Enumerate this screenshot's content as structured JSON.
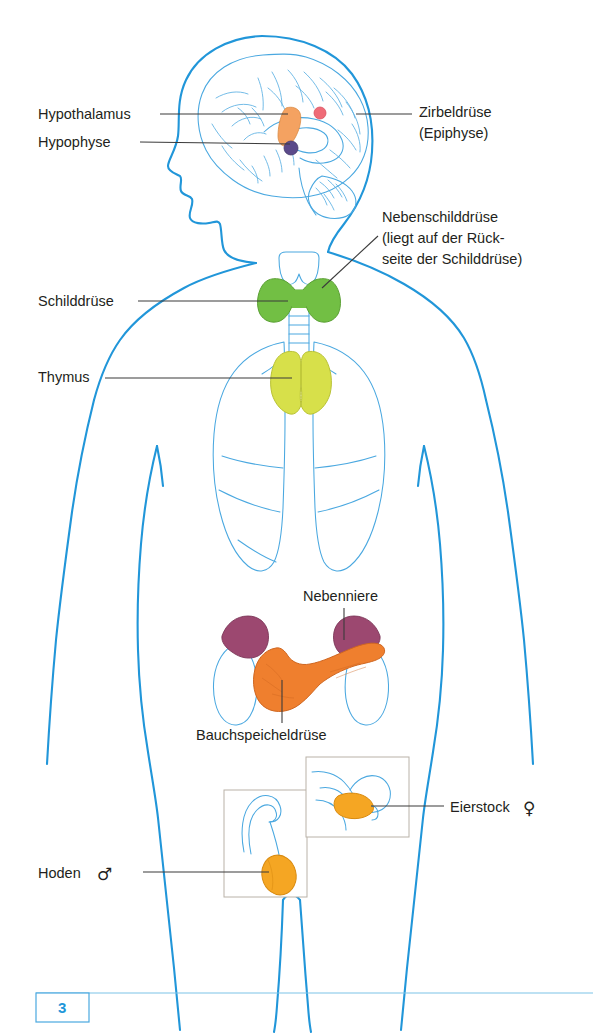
{
  "document": {
    "title": "Hormondrüsen des Menschen",
    "page_number": "3",
    "language": "de"
  },
  "colors": {
    "body_outline": "#2196d9",
    "organ_outline": "#4aa8e0",
    "leader_line": "#3b3b3b",
    "text": "#231f20",
    "thyroid_green": "#72bf44",
    "thymus_yellow": "#d7e04a",
    "pancreas_orange": "#ef7f2e",
    "adrenal_purple": "#9c4870",
    "hypothalamus_orange": "#f4a261",
    "hypophyse_violet": "#5b4a8a",
    "pineal_pink": "#ef6b77",
    "gonad_orange": "#f5a623",
    "inset_border": "#b9b2a8",
    "page_number_blue": "#2196d9"
  },
  "labels": [
    {
      "id": "hypothalamus",
      "lines": [
        "Hypothalamus"
      ],
      "side": "left",
      "text_x": 38,
      "text_y": 119,
      "leader": "M 160 114 L 288 114",
      "organ_color": "#f4a261"
    },
    {
      "id": "hypophyse",
      "lines": [
        "Hypophyse"
      ],
      "side": "left",
      "text_x": 38,
      "text_y": 147,
      "leader": "M 140 142 L 293 142",
      "organ_color": "#5b4a8a"
    },
    {
      "id": "zirbeldruese",
      "lines": [
        "Zirbeldrüse",
        "(Epiphyse)"
      ],
      "side": "right",
      "text_x": 419,
      "text_y": 117,
      "leader": "M 356 114 L 412 114",
      "organ_color": "#ef6b77"
    },
    {
      "id": "nebenschilddruese",
      "lines": [
        "Nebenschilddrüse",
        "(liegt auf der Rück-",
        "seite der Schilddrüse)"
      ],
      "side": "right",
      "text_x": 382,
      "text_y": 222,
      "leader": "M 320 287 L 378 234",
      "organ_color": "#72bf44"
    },
    {
      "id": "schilddruese",
      "lines": [
        "Schilddrüse"
      ],
      "side": "left",
      "text_x": 38,
      "text_y": 306,
      "leader": "M 138 301 L 287 301",
      "organ_color": "#72bf44"
    },
    {
      "id": "thymus",
      "lines": [
        "Thymus"
      ],
      "side": "left",
      "text_x": 38,
      "text_y": 382,
      "leader": "M 105 378 L 292 378",
      "organ_color": "#d7e04a"
    },
    {
      "id": "nebenniere",
      "lines": [
        "Nebenniere"
      ],
      "side": "top",
      "text_x": 303,
      "text_y": 601,
      "leader": "M 344 608 L 344 640",
      "organ_color": "#9c4870"
    },
    {
      "id": "bauchspeicheldruese",
      "lines": [
        "Bauchspeicheldrüse"
      ],
      "side": "bottom",
      "text_x": 196,
      "text_y": 740,
      "leader": "M 282 723 L 282 680",
      "organ_color": "#ef7f2e"
    },
    {
      "id": "eierstock",
      "lines": [
        "Eierstock"
      ],
      "symbol": "♀",
      "side": "right",
      "text_x": 450,
      "text_y": 812,
      "leader": "M 379 806 L 444 806",
      "organ_color": "#f5a623"
    },
    {
      "id": "hoden",
      "lines": [
        "Hoden"
      ],
      "symbol": "♂",
      "side": "left",
      "text_x": 38,
      "text_y": 878,
      "leader": "M 143 872 L 269 872",
      "organ_color": "#f5a623"
    }
  ],
  "insets": [
    {
      "id": "testis-inset",
      "x": 224,
      "y": 790,
      "w": 83,
      "h": 107
    },
    {
      "id": "ovary-inset",
      "x": 306,
      "y": 757,
      "w": 103,
      "h": 80
    }
  ]
}
